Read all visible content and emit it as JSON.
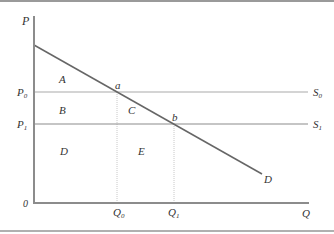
{
  "diagram": {
    "type": "economics-supply-demand",
    "axes": {
      "y_label": "P",
      "x_label": "Q",
      "origin_label": "0"
    },
    "price_levels": [
      {
        "label": "P",
        "sub": "0",
        "supply_label": "S",
        "supply_sub": "0"
      },
      {
        "label": "P",
        "sub": "1",
        "supply_label": "S",
        "supply_sub": "1"
      }
    ],
    "quantity_levels": [
      {
        "label": "Q",
        "sub": "0"
      },
      {
        "label": "Q",
        "sub": "1"
      }
    ],
    "demand_label": "D",
    "points": {
      "a": "a",
      "b": "b"
    },
    "regions": {
      "A": "A",
      "B": "B",
      "C": "C",
      "D": "D",
      "E": "E"
    },
    "colors": {
      "axis": "#8c8c8c",
      "demand": "#666666",
      "supply": "#aaaaaa",
      "guide": "#c8c8c8",
      "text": "#333333"
    }
  }
}
